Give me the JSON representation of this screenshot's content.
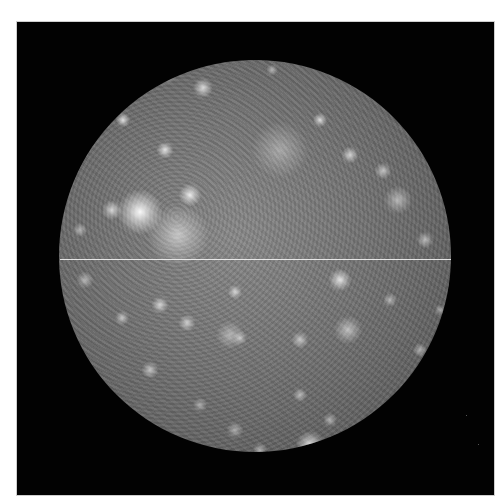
{
  "image": {
    "subject": "Callisto moon photograph",
    "colors": {
      "page_background": "#ffffff",
      "frame_background": "#020202",
      "scan_line": "#f2f2f2"
    },
    "frame": {
      "x": 17,
      "y": 22,
      "width": 477,
      "height": 473
    },
    "disk": {
      "cx": 255,
      "cy": 256,
      "r": 196
    },
    "scan_line": {
      "y": 259,
      "x_start": 60,
      "x_end": 451
    },
    "bright_spots": [
      {
        "x": 140,
        "y": 212,
        "r": 16,
        "a": 0.95
      },
      {
        "x": 112,
        "y": 210,
        "r": 7,
        "a": 0.7
      },
      {
        "x": 190,
        "y": 195,
        "r": 8,
        "a": 0.85
      },
      {
        "x": 178,
        "y": 235,
        "r": 22,
        "a": 0.55
      },
      {
        "x": 165,
        "y": 150,
        "r": 6,
        "a": 0.8
      },
      {
        "x": 123,
        "y": 120,
        "r": 5,
        "a": 0.8
      },
      {
        "x": 203,
        "y": 88,
        "r": 7,
        "a": 0.75
      },
      {
        "x": 166,
        "y": 73,
        "r": 8,
        "a": 0.6
      },
      {
        "x": 320,
        "y": 120,
        "r": 5,
        "a": 0.75
      },
      {
        "x": 350,
        "y": 155,
        "r": 6,
        "a": 0.7
      },
      {
        "x": 383,
        "y": 171,
        "r": 6,
        "a": 0.6
      },
      {
        "x": 398,
        "y": 200,
        "r": 10,
        "a": 0.5
      },
      {
        "x": 425,
        "y": 240,
        "r": 6,
        "a": 0.55
      },
      {
        "x": 280,
        "y": 150,
        "r": 20,
        "a": 0.35
      },
      {
        "x": 340,
        "y": 280,
        "r": 8,
        "a": 0.8
      },
      {
        "x": 348,
        "y": 330,
        "r": 10,
        "a": 0.55
      },
      {
        "x": 300,
        "y": 340,
        "r": 6,
        "a": 0.6
      },
      {
        "x": 240,
        "y": 338,
        "r": 5,
        "a": 0.55
      },
      {
        "x": 160,
        "y": 305,
        "r": 6,
        "a": 0.7
      },
      {
        "x": 122,
        "y": 318,
        "r": 5,
        "a": 0.6
      },
      {
        "x": 187,
        "y": 323,
        "r": 6,
        "a": 0.65
      },
      {
        "x": 150,
        "y": 370,
        "r": 6,
        "a": 0.6
      },
      {
        "x": 235,
        "y": 292,
        "r": 5,
        "a": 0.7
      },
      {
        "x": 230,
        "y": 335,
        "r": 10,
        "a": 0.45
      },
      {
        "x": 310,
        "y": 445,
        "r": 10,
        "a": 0.8
      },
      {
        "x": 300,
        "y": 395,
        "r": 5,
        "a": 0.55
      },
      {
        "x": 260,
        "y": 450,
        "r": 5,
        "a": 0.5
      },
      {
        "x": 330,
        "y": 420,
        "r": 5,
        "a": 0.5
      },
      {
        "x": 400,
        "y": 410,
        "r": 6,
        "a": 0.55
      },
      {
        "x": 420,
        "y": 350,
        "r": 5,
        "a": 0.5
      },
      {
        "x": 235,
        "y": 430,
        "r": 6,
        "a": 0.45
      },
      {
        "x": 200,
        "y": 405,
        "r": 5,
        "a": 0.45
      },
      {
        "x": 85,
        "y": 280,
        "r": 6,
        "a": 0.5
      },
      {
        "x": 80,
        "y": 230,
        "r": 5,
        "a": 0.5
      },
      {
        "x": 272,
        "y": 70,
        "r": 4,
        "a": 0.5
      },
      {
        "x": 390,
        "y": 300,
        "r": 5,
        "a": 0.5
      },
      {
        "x": 440,
        "y": 310,
        "r": 4,
        "a": 0.45
      }
    ]
  }
}
